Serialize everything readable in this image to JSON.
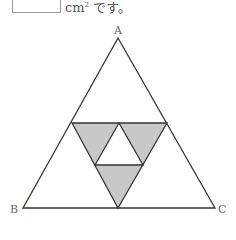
{
  "question": {
    "answer_box_value": "",
    "unit_text": "cm",
    "unit_exponent": "2",
    "suffix": " です。"
  },
  "figure": {
    "vertices": {
      "A": "A",
      "B": "B",
      "C": "C"
    },
    "shade_color": "#c8c8c8",
    "line_color": "#333333"
  }
}
